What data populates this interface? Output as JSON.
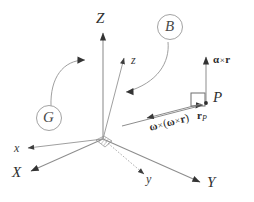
{
  "figure": {
    "background_color": "#ffffff",
    "ink_color": "#2e2e2e",
    "line_color": "#808080",
    "width": 254,
    "height": 202
  },
  "frames": {
    "ground": {
      "marker_label": "G",
      "axes": [
        {
          "name": "axis-X",
          "label": "X"
        },
        {
          "name": "axis-Y",
          "label": "Y"
        },
        {
          "name": "axis-Z",
          "label": "Z"
        }
      ]
    },
    "body": {
      "marker_label": "B",
      "axes": [
        {
          "name": "axis-x",
          "label": "x"
        },
        {
          "name": "axis-y",
          "label": "y"
        },
        {
          "name": "axis-z",
          "label": "z"
        }
      ]
    }
  },
  "point": {
    "label": "P"
  },
  "vectors": [
    {
      "name": "alpha-cross-r",
      "greek": "α",
      "cross": "×",
      "vec": "r",
      "label": "α×r"
    },
    {
      "name": "position-vector-rP",
      "vec": "r",
      "subscript": "P",
      "label": "r_P"
    },
    {
      "name": "omega-cross-omega-cross-r",
      "greek": "ω",
      "cross": "×",
      "open": "(",
      "greek2": "ω",
      "cross2": "×",
      "vec": "r",
      "close": ")",
      "label": "ω×(ω×r)"
    }
  ]
}
